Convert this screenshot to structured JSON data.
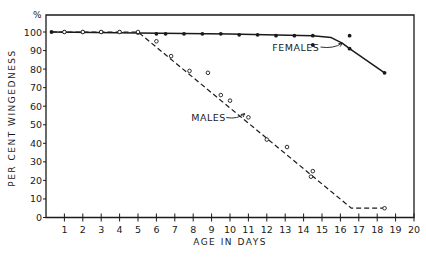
{
  "chart_data": {
    "type": "line",
    "title": "",
    "xlabel": "AGE IN DAYS",
    "ylabel": "PER CENT WINGEDNESS",
    "y_unit_label": "%",
    "xlim": [
      0,
      20
    ],
    "ylim": [
      0,
      100
    ],
    "x_ticks": [
      1,
      2,
      3,
      4,
      5,
      6,
      7,
      8,
      9,
      10,
      11,
      12,
      13,
      14,
      15,
      16,
      17,
      18,
      19,
      20
    ],
    "y_ticks": [
      0,
      10,
      20,
      30,
      40,
      50,
      60,
      70,
      80,
      90,
      100
    ],
    "grid": false,
    "legend": "inline annotations",
    "series": [
      {
        "name": "FEMALES",
        "line_style": "solid",
        "marker": "filled-dot",
        "points": [
          {
            "x": 0.3,
            "y": 100
          },
          {
            "x": 1,
            "y": 100
          },
          {
            "x": 2,
            "y": 100
          },
          {
            "x": 3,
            "y": 100
          },
          {
            "x": 4,
            "y": 100
          },
          {
            "x": 5,
            "y": 99.5
          },
          {
            "x": 6,
            "y": 99
          },
          {
            "x": 6.5,
            "y": 99
          },
          {
            "x": 7.5,
            "y": 99
          },
          {
            "x": 8.5,
            "y": 99
          },
          {
            "x": 9.5,
            "y": 99
          },
          {
            "x": 10.5,
            "y": 98.5
          },
          {
            "x": 11.5,
            "y": 98.5
          },
          {
            "x": 12.5,
            "y": 98
          },
          {
            "x": 13.5,
            "y": 98
          },
          {
            "x": 14.5,
            "y": 98
          },
          {
            "x": 16.5,
            "y": 91
          },
          {
            "x": 18.4,
            "y": 78
          }
        ],
        "scatter_only": [
          {
            "x": 14.5,
            "y": 93
          },
          {
            "x": 16.5,
            "y": 98
          }
        ],
        "line_path": [
          {
            "x": 0.3,
            "y": 100
          },
          {
            "x": 5,
            "y": 99.5
          },
          {
            "x": 10,
            "y": 99
          },
          {
            "x": 14.5,
            "y": 98
          },
          {
            "x": 15.5,
            "y": 97
          },
          {
            "x": 16.1,
            "y": 94
          },
          {
            "x": 16.5,
            "y": 91
          },
          {
            "x": 18.4,
            "y": 78
          }
        ]
      },
      {
        "name": "MALES",
        "line_style": "dashed",
        "marker": "open-circle",
        "points": [
          {
            "x": 1,
            "y": 100
          },
          {
            "x": 2,
            "y": 100
          },
          {
            "x": 3,
            "y": 100
          },
          {
            "x": 4,
            "y": 100
          },
          {
            "x": 5,
            "y": 100
          },
          {
            "x": 6,
            "y": 95
          },
          {
            "x": 6.8,
            "y": 87
          },
          {
            "x": 7.8,
            "y": 79
          },
          {
            "x": 8.8,
            "y": 78
          },
          {
            "x": 9.5,
            "y": 66
          },
          {
            "x": 10,
            "y": 63
          },
          {
            "x": 11,
            "y": 54
          },
          {
            "x": 12,
            "y": 42
          },
          {
            "x": 13.1,
            "y": 38
          },
          {
            "x": 14.5,
            "y": 25
          },
          {
            "x": 14.4,
            "y": 22
          },
          {
            "x": 18.4,
            "y": 5
          }
        ],
        "line_path": [
          {
            "x": 0.3,
            "y": 100
          },
          {
            "x": 5,
            "y": 100
          },
          {
            "x": 16.6,
            "y": 5
          },
          {
            "x": 18.4,
            "y": 5
          }
        ]
      }
    ],
    "annotations": [
      {
        "text": "FEMALES",
        "x": 12.3,
        "y": 90,
        "arrow_to": {
          "x": 16.1,
          "y": 94
        }
      },
      {
        "text": "MALES",
        "x": 7.9,
        "y": 52,
        "arrow_to": {
          "x": 10.8,
          "y": 56
        }
      }
    ]
  },
  "colors": {
    "ink": "#1a1a1a",
    "background": "#ffffff"
  }
}
